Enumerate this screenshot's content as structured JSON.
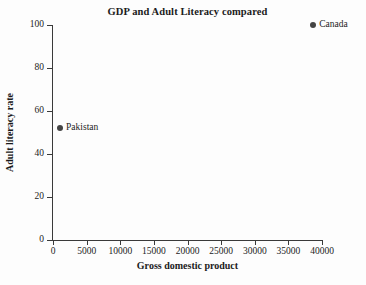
{
  "chart_data": {
    "type": "scatter",
    "title": "GDP and Adult Literacy compared",
    "xlabel": "Gross domestic product",
    "ylabel": "Adult literacy rate",
    "xlim": [
      0,
      40000
    ],
    "ylim": [
      0,
      100
    ],
    "xticks": [
      0,
      5000,
      10000,
      15000,
      20000,
      25000,
      30000,
      35000,
      40000
    ],
    "xtick_labels": [
      "0",
      "5000",
      "10000",
      "15000",
      "20000",
      "25000",
      "30000",
      "35000",
      "40000"
    ],
    "yticks": [
      0,
      20,
      40,
      60,
      80,
      100
    ],
    "ytick_labels": [
      "0",
      "20",
      "40",
      "60",
      "80",
      "100"
    ],
    "grid": false,
    "legend": "none",
    "point_color": "#444444",
    "axis_color": "#3a3a3a",
    "background": "#fdfdfd",
    "points": [
      {
        "label": "Canada",
        "x": 38700,
        "y": 100
      },
      {
        "label": "Pakistan",
        "x": 1050,
        "y": 52
      }
    ]
  }
}
